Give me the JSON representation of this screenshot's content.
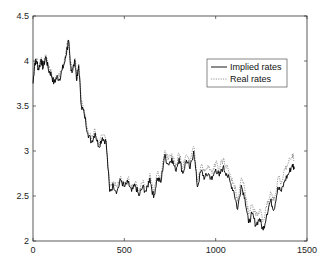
{
  "chart_data": {
    "type": "line",
    "title": "",
    "xlabel": "",
    "ylabel": "",
    "xlim": [
      0,
      1500
    ],
    "ylim": [
      2,
      4.5
    ],
    "grid": false,
    "legend_position": "upper right (inside)",
    "x_ticks": [
      0,
      500,
      1000,
      1500
    ],
    "x_tick_labels": [
      "0",
      "500",
      "1000",
      "1500"
    ],
    "y_ticks": [
      2,
      2.5,
      3,
      3.5,
      4,
      4.5
    ],
    "y_tick_labels": [
      "2",
      "2.5",
      "3",
      "3.5",
      "4",
      "4.5"
    ],
    "series": [
      {
        "name": "Implied rates",
        "style": "solid",
        "color": "#000000",
        "x": [
          0,
          10,
          20,
          30,
          45,
          55,
          70,
          85,
          100,
          115,
          130,
          145,
          160,
          175,
          185,
          195,
          205,
          215,
          230,
          240,
          250,
          265,
          280,
          300,
          320,
          340,
          360,
          380,
          400,
          420,
          440,
          460,
          480,
          500,
          520,
          540,
          560,
          580,
          600,
          620,
          640,
          660,
          680,
          700,
          720,
          740,
          760,
          780,
          800,
          820,
          840,
          860,
          880,
          900,
          920,
          940,
          960,
          980,
          1000,
          1020,
          1040,
          1060,
          1080,
          1100,
          1120,
          1140,
          1160,
          1180,
          1200,
          1220,
          1240,
          1260,
          1280,
          1300,
          1320,
          1340,
          1360,
          1380,
          1400,
          1420,
          1430
        ],
        "values": [
          3.75,
          3.98,
          4.0,
          3.9,
          4.02,
          3.92,
          4.05,
          3.9,
          3.85,
          3.75,
          3.82,
          3.8,
          3.9,
          4.0,
          4.12,
          4.22,
          3.95,
          3.88,
          4.0,
          3.78,
          3.95,
          3.5,
          3.42,
          3.2,
          3.1,
          3.2,
          3.05,
          3.15,
          3.1,
          2.55,
          2.62,
          2.55,
          2.68,
          2.6,
          2.65,
          2.55,
          2.62,
          2.5,
          2.6,
          2.55,
          2.7,
          2.48,
          2.7,
          2.65,
          2.95,
          2.85,
          2.92,
          2.78,
          2.92,
          2.75,
          2.9,
          2.8,
          3.0,
          2.6,
          2.78,
          2.7,
          2.75,
          2.68,
          2.8,
          2.72,
          2.82,
          2.75,
          2.65,
          2.55,
          2.35,
          2.62,
          2.48,
          2.2,
          2.3,
          2.18,
          2.25,
          2.12,
          2.3,
          2.45,
          2.35,
          2.6,
          2.55,
          2.68,
          2.75,
          2.85,
          2.8
        ]
      },
      {
        "name": "Real rates",
        "style": "dotted",
        "color": "#888888",
        "x": [
          0,
          10,
          20,
          30,
          45,
          55,
          70,
          85,
          100,
          115,
          130,
          145,
          160,
          175,
          185,
          195,
          205,
          215,
          230,
          240,
          250,
          265,
          280,
          300,
          320,
          340,
          360,
          380,
          400,
          420,
          440,
          460,
          480,
          500,
          520,
          540,
          560,
          580,
          600,
          620,
          640,
          660,
          680,
          700,
          720,
          740,
          760,
          780,
          800,
          820,
          840,
          860,
          880,
          900,
          920,
          940,
          960,
          980,
          1000,
          1020,
          1040,
          1060,
          1080,
          1100,
          1120,
          1140,
          1160,
          1180,
          1200,
          1220,
          1240,
          1260,
          1280,
          1300,
          1320,
          1340,
          1360,
          1380,
          1400,
          1420,
          1430
        ],
        "values": [
          3.78,
          4.0,
          4.02,
          3.93,
          4.04,
          3.95,
          4.07,
          3.92,
          3.87,
          3.78,
          3.84,
          3.83,
          3.92,
          4.03,
          4.15,
          4.24,
          3.98,
          3.9,
          4.03,
          3.8,
          3.97,
          3.53,
          3.45,
          3.23,
          3.13,
          3.23,
          3.08,
          3.18,
          3.13,
          2.6,
          2.66,
          2.6,
          2.72,
          2.64,
          2.7,
          2.6,
          2.66,
          2.55,
          2.65,
          2.6,
          2.75,
          2.53,
          2.75,
          2.7,
          3.0,
          2.9,
          2.97,
          2.83,
          2.97,
          2.8,
          2.96,
          2.86,
          3.05,
          2.66,
          2.84,
          2.77,
          2.82,
          2.75,
          2.87,
          2.8,
          2.9,
          2.83,
          2.74,
          2.64,
          2.44,
          2.7,
          2.57,
          2.3,
          2.4,
          2.28,
          2.35,
          2.22,
          2.4,
          2.55,
          2.45,
          2.7,
          2.66,
          2.8,
          2.88,
          2.97,
          2.9
        ]
      }
    ]
  },
  "legend": {
    "items": [
      {
        "label": "Implied rates",
        "style": "solid"
      },
      {
        "label": "Real rates",
        "style": "dotted"
      }
    ]
  },
  "axes": {
    "x_tick_labels": [
      "0",
      "500",
      "1000",
      "1500"
    ],
    "y_tick_labels": [
      "2",
      "2.5",
      "3",
      "3.5",
      "4",
      "4.5"
    ]
  }
}
